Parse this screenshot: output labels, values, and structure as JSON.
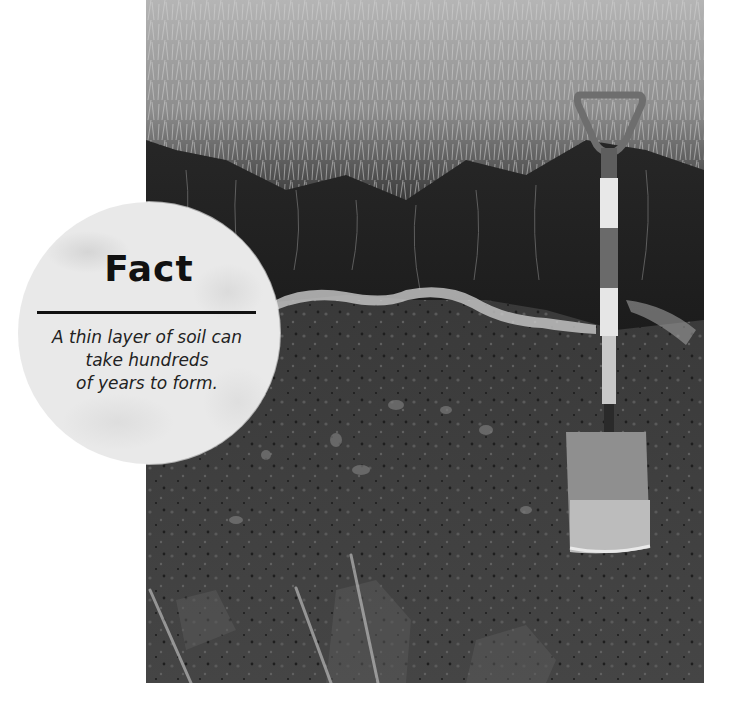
{
  "photo": {
    "subject": "soil profile with spade",
    "description": "Black-and-white photograph of a dug soil pit showing grass on top, dark topsoil, a pale band, and subsoil, with a spade standing upright on the right"
  },
  "fact_box": {
    "title": "Fact",
    "lines": [
      "A thin layer of soil can",
      "take hundreds",
      "of years to form."
    ]
  }
}
